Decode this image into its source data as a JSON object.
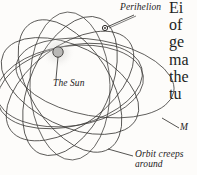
{
  "figure": {
    "background_color": "#fdfcfa",
    "orbit_color": "#3a3836",
    "sun_fill": "#b9b8b6",
    "sun_stroke": "#4a4846",
    "leader_color": "#2a2826"
  },
  "labels": {
    "perihelion": "Perihelion",
    "sun": "The Sun",
    "mercury_clipped": "M",
    "orbit_creeps_line1": "Orbit creeps",
    "orbit_creeps_line2": "around"
  },
  "body_text_clipped": {
    "line1": "Ei",
    "line2": "of",
    "line3": "ge",
    "line4": "ma",
    "line5": "the",
    "line6": "tu"
  },
  "markers": {
    "sun_center_x": 58,
    "sun_center_y": 52,
    "sun_radius": 5.2,
    "perihelion_x": 105,
    "perihelion_y": 28,
    "perihelion_radius": 2.6
  },
  "orbits": [
    {
      "cx": 70,
      "cy": 86,
      "rx": 74,
      "ry": 40,
      "rotation": -8
    },
    {
      "cx": 70,
      "cy": 86,
      "rx": 74,
      "ry": 40,
      "rotation": 26
    },
    {
      "cx": 70,
      "cy": 86,
      "rx": 74,
      "ry": 40,
      "rotation": 58
    },
    {
      "cx": 70,
      "cy": 86,
      "rx": 74,
      "ry": 40,
      "rotation": 88
    },
    {
      "cx": 70,
      "cy": 86,
      "rx": 74,
      "ry": 40,
      "rotation": 114
    },
    {
      "cx": 70,
      "cy": 86,
      "rx": 74,
      "ry": 40,
      "rotation": 143
    },
    {
      "cx": 70,
      "cy": 86,
      "rx": 74,
      "ry": 40,
      "rotation": 166
    }
  ]
}
